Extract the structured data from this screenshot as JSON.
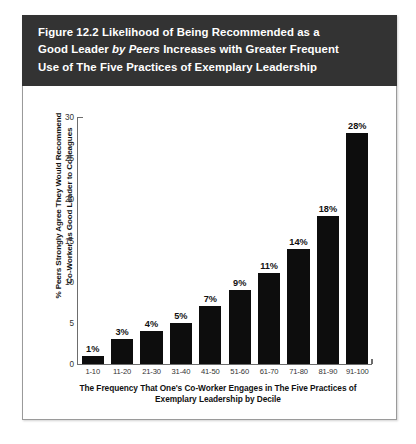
{
  "figure": {
    "title_line1_pre": "Figure 12.2  Likelihood of Being Recommended as a",
    "title_line2_pre": "Good Leader ",
    "title_line2_italic": "by Peers",
    "title_line2_post": " Increases with Greater Frequent",
    "title_line3": "Use of The Five Practices of Exemplary Leadership",
    "header_color": "#333333",
    "bar_color": "#0d0d0d"
  },
  "chart_data": {
    "type": "bar",
    "title": "Figure 12.2  Likelihood of Being Recommended as a Good Leader by Peers Increases with Greater Frequent Use of The Five Practices of Exemplary Leadership",
    "categories": [
      "1-10",
      "11-20",
      "21-30",
      "31-40",
      "41-50",
      "51-60",
      "61-70",
      "71-80",
      "81-90",
      "91-100"
    ],
    "values": [
      1,
      3,
      4,
      5,
      7,
      9,
      11,
      14,
      18,
      28
    ],
    "data_labels": [
      "1%",
      "3%",
      "4%",
      "5%",
      "7%",
      "9%",
      "11%",
      "14%",
      "18%",
      "28%"
    ],
    "xlabel_line1": "The Frequency That One's Co-Worker Engages in The Five Practices of",
    "xlabel_line2": "Exemplary Leadership by Decile",
    "ylabel_line1": "% Peers Strongly Agree They Would Recommend",
    "ylabel_line2": "Co-Worker as Good Leader to Colleagues",
    "ylim": [
      0,
      30
    ],
    "yticks": [
      0,
      5,
      10,
      15,
      20,
      25,
      30
    ],
    "ytick_labels": [
      "0",
      "5",
      "10",
      "15",
      "20",
      "25",
      "30"
    ],
    "grid": false,
    "legend": false
  }
}
